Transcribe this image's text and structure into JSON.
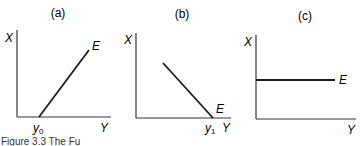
{
  "figure": {
    "caption": "Figure 3.3 The Fu",
    "panels": [
      {
        "id": "a",
        "title": "(a)",
        "y_axis_label": "X",
        "x_axis_label": "Y",
        "line_label": "E",
        "intercept_label": "y",
        "intercept_subscript": "0",
        "slope": "positive"
      },
      {
        "id": "b",
        "title": "(b)",
        "y_axis_label": "X",
        "x_axis_label": "Y",
        "line_label": "E",
        "intercept_label": "y",
        "intercept_subscript": "1",
        "slope": "negative"
      },
      {
        "id": "c",
        "title": "(c)",
        "y_axis_label": "X",
        "x_axis_label": "Y",
        "line_label": "E",
        "slope": "zero"
      }
    ]
  },
  "colors": {
    "line": "#1a1a1a",
    "axis": "#333333",
    "background": "#ffffff"
  }
}
